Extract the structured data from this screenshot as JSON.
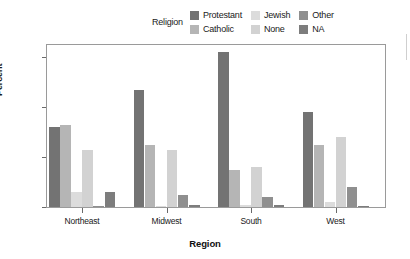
{
  "legend": {
    "title": "Religion",
    "items": [
      {
        "label": "Protestant",
        "color": "#737373"
      },
      {
        "label": "Jewish",
        "color": "#dcdcdc"
      },
      {
        "label": "Other",
        "color": "#8f8f8f"
      },
      {
        "label": "Catholic",
        "color": "#b5b5b5"
      },
      {
        "label": "None",
        "color": "#d2d2d2"
      },
      {
        "label": "NA",
        "color": "#7d7d7d"
      }
    ]
  },
  "axes": {
    "ylabel": "Percent",
    "xlabel": "Region",
    "yticks": [
      "0",
      "20",
      "40",
      "60"
    ]
  },
  "chart_data": {
    "type": "bar",
    "title": "",
    "xlabel": "Region",
    "ylabel": "Percent",
    "ylim": [
      0,
      65
    ],
    "grid": false,
    "legend_position": "top",
    "legend_title": "Religion",
    "categories": [
      "Northeast",
      "Midwest",
      "South",
      "West"
    ],
    "series": [
      {
        "name": "Protestant",
        "color": "#737373",
        "values": [
          32,
          47,
          62,
          38
        ]
      },
      {
        "name": "Catholic",
        "color": "#b5b5b5",
        "values": [
          33,
          25,
          15,
          25
        ]
      },
      {
        "name": "Jewish",
        "color": "#dcdcdc",
        "values": [
          6,
          0.5,
          1,
          2
        ]
      },
      {
        "name": "None",
        "color": "#d2d2d2",
        "values": [
          23,
          23,
          16,
          28
        ]
      },
      {
        "name": "Other",
        "color": "#8f8f8f",
        "values": [
          0.4,
          5,
          4,
          8
        ]
      },
      {
        "name": "NA",
        "color": "#7d7d7d",
        "values": [
          6,
          1,
          1,
          0.3
        ]
      }
    ]
  }
}
